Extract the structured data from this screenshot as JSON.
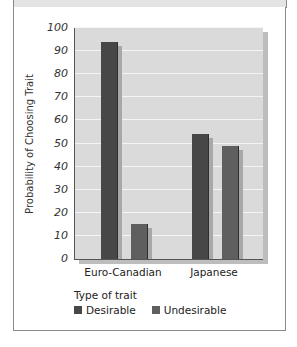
{
  "chart_data": {
    "type": "bar",
    "title": "",
    "xlabel": "",
    "ylabel": "Probability of Choosing Trait",
    "ylim": [
      0,
      100
    ],
    "yticks": [
      0,
      10,
      20,
      30,
      40,
      50,
      60,
      70,
      80,
      90,
      100
    ],
    "grid": true,
    "categories": [
      "Euro-Canadian",
      "Japanese"
    ],
    "series": [
      {
        "name": "Desirable",
        "values": [
          94,
          54
        ],
        "color": "#474747"
      },
      {
        "name": "Undesirable",
        "values": [
          15,
          49
        ],
        "color": "#5f5f5f"
      }
    ],
    "legend_title": "Type of trait",
    "legend_position": "bottom-left"
  },
  "axis": {
    "ylabel": "Probability of Choosing Trait",
    "ticks": [
      "0",
      "10",
      "20",
      "30",
      "40",
      "50",
      "60",
      "70",
      "80",
      "90",
      "100"
    ]
  },
  "categories": [
    "Euro-Canadian",
    "Japanese"
  ],
  "legend": {
    "title": "Type of trait",
    "items": [
      {
        "label": "Desirable",
        "color": "#474747"
      },
      {
        "label": "Undesirable",
        "color": "#5f5f5f"
      }
    ]
  }
}
